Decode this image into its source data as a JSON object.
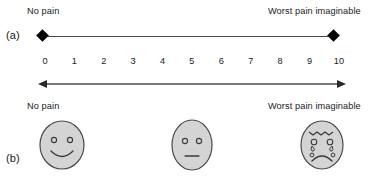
{
  "figure": {
    "panels": {
      "a": "(a)",
      "b": "(b)"
    }
  },
  "vas": {
    "left_anchor": "No pain",
    "right_anchor": "Worst pain imaginable",
    "left_marker_icon": "diamond-marker-icon",
    "right_marker_icon": "diamond-marker-icon",
    "line_color": "#4a4a4a",
    "marker_color": "#000000"
  },
  "nrs": {
    "numbers": [
      "0",
      "1",
      "2",
      "3",
      "4",
      "5",
      "6",
      "7",
      "8",
      "9",
      "10"
    ],
    "arrow_icon": "double-headed-arrow-icon",
    "arrow_color": "#4a4a4a"
  },
  "faces": {
    "left_anchor": "No pain",
    "right_anchor": "Worst pain imaginable",
    "fill_color": "#d4d4d4",
    "stroke_color": "#4a4a4a",
    "items": [
      {
        "name": "happy-face-icon",
        "expression": "smiling"
      },
      {
        "name": "neutral-face-icon",
        "expression": "neutral"
      },
      {
        "name": "crying-face-icon",
        "expression": "distressed-crying"
      }
    ]
  }
}
